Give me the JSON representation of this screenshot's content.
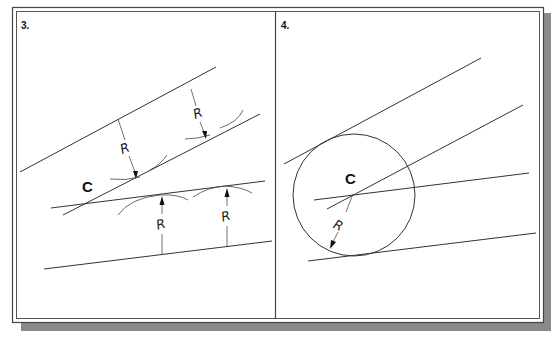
{
  "figure": {
    "panels": [
      {
        "id": "3",
        "label": "3.",
        "center_label": "C",
        "radius_labels": [
          "R",
          "R",
          "R",
          "R"
        ],
        "description": "Two pairs of non-parallel lines with parallel offset lines at distance R; intersection of offsets locates center C"
      },
      {
        "id": "4",
        "label": "4.",
        "center_label": "C",
        "radius_labels": [
          "R"
        ],
        "description": "Circle of radius R drawn about center C tangent to both original lines"
      }
    ]
  },
  "colors": {
    "line": "#333333",
    "frame": "#444444",
    "shadow": "#8a8a8a",
    "background": "#ffffff"
  }
}
